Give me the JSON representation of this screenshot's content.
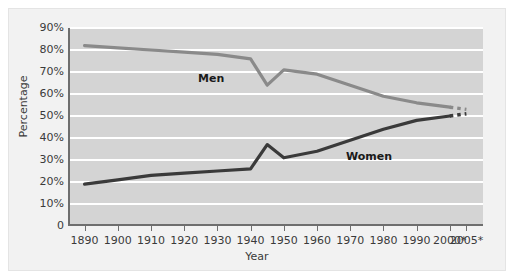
{
  "chart_data": {
    "type": "line",
    "title": "",
    "xlabel": "Year",
    "ylabel": "Percentage",
    "xlim": [
      1885,
      2010
    ],
    "ylim": [
      0,
      90
    ],
    "grid": true,
    "legend_position": "inline-labels",
    "x_tick_labels": [
      "1890",
      "1900",
      "1910",
      "1920",
      "1930",
      "1940",
      "1950",
      "1960",
      "1970",
      "1980",
      "1990",
      "2000*",
      "2005*"
    ],
    "x_tick_values": [
      1890,
      1900,
      1910,
      1920,
      1930,
      1940,
      1950,
      1960,
      1970,
      1980,
      1990,
      2000,
      2005
    ],
    "y_tick_labels": [
      "0",
      "10%",
      "20%",
      "30%",
      "40%",
      "50%",
      "60%",
      "70%",
      "80%",
      "90%"
    ],
    "y_tick_values": [
      0,
      10,
      20,
      30,
      40,
      50,
      60,
      70,
      80,
      90
    ],
    "series": [
      {
        "name": "Men",
        "color": "#8a8a8a",
        "label_text": "Men",
        "x": [
          1890,
          1900,
          1910,
          1920,
          1930,
          1940,
          1945,
          1950,
          1960,
          1970,
          1980,
          1990,
          2000
        ],
        "values": [
          82,
          81,
          80,
          79,
          78,
          76,
          64,
          71,
          69,
          64,
          59,
          56,
          54
        ],
        "projection_x": [
          2000,
          2005
        ],
        "projection_values": [
          54,
          53
        ],
        "projection_style": "dashed"
      },
      {
        "name": "Women",
        "color": "#3a3a3a",
        "label_text": "Women",
        "x": [
          1890,
          1900,
          1910,
          1920,
          1930,
          1940,
          1945,
          1950,
          1960,
          1970,
          1980,
          1990,
          2000
        ],
        "values": [
          19,
          21,
          23,
          24,
          25,
          26,
          37,
          31,
          34,
          39,
          44,
          48,
          50
        ],
        "projection_x": [
          2000,
          2005
        ],
        "projection_values": [
          50,
          51
        ],
        "projection_style": "dashed"
      }
    ]
  },
  "style": {
    "plot_background": "#d4d4d4",
    "gridline_color": "#ffffff",
    "axis_color": "#6e6e6e",
    "figure_background": "#f2f2f2"
  }
}
